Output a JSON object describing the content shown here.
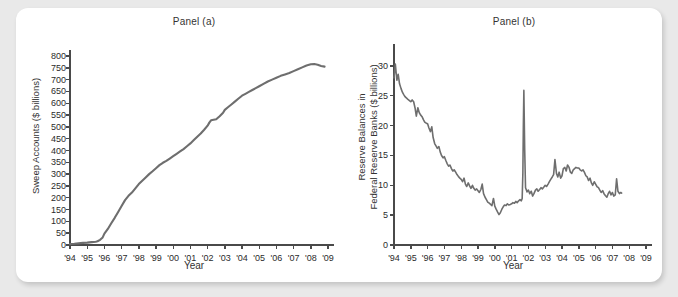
{
  "figure": {
    "background_color": "#e9e9e9",
    "card_color": "#ffffff",
    "line_color": "#6e6e6e",
    "axis_color": "#4a4a4a",
    "grid_color": "#9a9a9a"
  },
  "panels": [
    {
      "key": "a",
      "title": "Panel (a)",
      "ylabel": "Sweep Accounts ($ billions)",
      "xlabel": "Year"
    },
    {
      "key": "b",
      "title": "Panel (b)",
      "ylabel_line1": "Reserve Balances in",
      "ylabel_line2": "Federal Reserve Banks ($ billions)",
      "xlabel": "Year"
    }
  ],
  "chart_data": [
    {
      "type": "line",
      "panel": "a",
      "title": "Panel (a)",
      "xlabel": "Year",
      "ylabel": "Sweep Accounts ($ billions)",
      "xlim": [
        1994,
        2009
      ],
      "ylim": [
        0,
        800
      ],
      "ytick_values": [
        0,
        50,
        100,
        150,
        200,
        250,
        300,
        350,
        400,
        450,
        500,
        550,
        600,
        650,
        700,
        750,
        800
      ],
      "ytick_labels": [
        "0",
        "50",
        "100",
        "150",
        "200",
        "250",
        "300",
        "350",
        "400",
        "450",
        "500",
        "550",
        "600",
        "650",
        "700",
        "750",
        "800"
      ],
      "xtick_values": [
        1994,
        1995,
        1996,
        1997,
        1998,
        1999,
        2000,
        2001,
        2002,
        2003,
        2004,
        2005,
        2006,
        2007,
        2008,
        2009
      ],
      "xtick_labels": [
        "'94",
        "'95",
        "'96",
        "'97",
        "'98",
        "'99",
        "'00",
        "'01",
        "'02",
        "'03",
        "'04",
        "'05",
        "'06",
        "'07",
        "'08",
        "'09"
      ],
      "grid": "horizontal-dotted",
      "legend": "none",
      "series": [
        {
          "name": "Sweep Accounts",
          "x": [
            1994.0,
            1994.25,
            1994.5,
            1994.75,
            1995.0,
            1995.25,
            1995.5,
            1995.6,
            1995.75,
            1995.9,
            1996.0,
            1996.2,
            1996.4,
            1996.6,
            1996.8,
            1997.0,
            1997.2,
            1997.4,
            1997.6,
            1997.8,
            1998.0,
            1998.2,
            1998.4,
            1998.6,
            1998.8,
            1999.0,
            1999.2,
            1999.4,
            1999.6,
            1999.8,
            2000.0,
            2000.2,
            2000.4,
            2000.6,
            2000.8,
            2001.0,
            2001.2,
            2001.4,
            2001.6,
            2001.8,
            2002.0,
            2002.1,
            2002.2,
            2002.35,
            2002.5,
            2002.7,
            2002.9,
            2003.0,
            2003.2,
            2003.4,
            2003.6,
            2003.8,
            2004.0,
            2004.2,
            2004.4,
            2004.6,
            2004.8,
            2005.0,
            2005.25,
            2005.5,
            2005.75,
            2006.0,
            2006.25,
            2006.5,
            2006.75,
            2007.0,
            2007.25,
            2007.5,
            2007.75,
            2008.0,
            2008.2,
            2008.4,
            2008.6,
            2008.8
          ],
          "y": [
            4,
            5,
            7,
            9,
            10,
            12,
            14,
            16,
            22,
            32,
            48,
            68,
            92,
            115,
            140,
            165,
            190,
            208,
            222,
            240,
            258,
            272,
            286,
            300,
            312,
            325,
            338,
            348,
            356,
            366,
            376,
            386,
            396,
            406,
            418,
            430,
            444,
            458,
            472,
            488,
            505,
            518,
            528,
            530,
            532,
            545,
            560,
            572,
            584,
            596,
            608,
            620,
            632,
            640,
            648,
            656,
            664,
            672,
            682,
            692,
            700,
            708,
            716,
            722,
            728,
            736,
            744,
            752,
            760,
            765,
            766,
            763,
            758,
            755
          ]
        }
      ]
    },
    {
      "type": "line",
      "panel": "b",
      "title": "Panel (b)",
      "xlabel": "Year",
      "ylabel": "Reserve Balances in Federal Reserve Banks ($ billions)",
      "xlim": [
        1994,
        2009
      ],
      "ylim": [
        0,
        32
      ],
      "ytick_values": [
        0,
        5,
        10,
        15,
        20,
        25,
        30
      ],
      "ytick_labels": [
        "0",
        "5",
        "10",
        "15",
        "20",
        "25",
        "30"
      ],
      "xtick_values": [
        1994,
        1995,
        1996,
        1997,
        1998,
        1999,
        2000,
        2001,
        2002,
        2003,
        2004,
        2005,
        2006,
        2007,
        2008,
        2009
      ],
      "xtick_labels": [
        "'94",
        "'95",
        "'96",
        "'97",
        "'98",
        "'99",
        "'00",
        "'01",
        "'02",
        "'03",
        "'04",
        "'05",
        "'06",
        "'07",
        "'08",
        "'09"
      ],
      "grid": "horizontal-dotted",
      "legend": "none",
      "series": [
        {
          "name": "Reserve Balances",
          "x": [
            1994.0,
            1994.08,
            1994.17,
            1994.25,
            1994.33,
            1994.42,
            1994.5,
            1994.58,
            1994.67,
            1994.75,
            1994.83,
            1994.92,
            1995.0,
            1995.08,
            1995.17,
            1995.25,
            1995.33,
            1995.42,
            1995.5,
            1995.58,
            1995.67,
            1995.75,
            1995.83,
            1995.92,
            1996.0,
            1996.08,
            1996.17,
            1996.25,
            1996.33,
            1996.42,
            1996.5,
            1996.58,
            1996.67,
            1996.75,
            1996.83,
            1996.92,
            1997.0,
            1997.08,
            1997.17,
            1997.25,
            1997.33,
            1997.42,
            1997.5,
            1997.58,
            1997.67,
            1997.75,
            1997.83,
            1997.92,
            1998.0,
            1998.08,
            1998.17,
            1998.25,
            1998.33,
            1998.42,
            1998.5,
            1998.58,
            1998.67,
            1998.75,
            1998.83,
            1998.92,
            1999.0,
            1999.08,
            1999.17,
            1999.25,
            1999.33,
            1999.42,
            1999.5,
            1999.58,
            1999.67,
            1999.75,
            1999.83,
            1999.92,
            2000.0,
            2000.08,
            2000.17,
            2000.25,
            2000.33,
            2000.42,
            2000.5,
            2000.58,
            2000.67,
            2000.75,
            2000.83,
            2000.92,
            2001.0,
            2001.08,
            2001.17,
            2001.25,
            2001.33,
            2001.42,
            2001.5,
            2001.58,
            2001.63,
            2001.67,
            2001.7,
            2001.73,
            2001.78,
            2001.83,
            2001.92,
            2002.0,
            2002.08,
            2002.17,
            2002.25,
            2002.33,
            2002.42,
            2002.5,
            2002.58,
            2002.67,
            2002.75,
            2002.83,
            2002.92,
            2003.0,
            2003.08,
            2003.17,
            2003.25,
            2003.33,
            2003.42,
            2003.5,
            2003.58,
            2003.67,
            2003.75,
            2003.83,
            2003.92,
            2004.0,
            2004.08,
            2004.17,
            2004.25,
            2004.33,
            2004.42,
            2004.5,
            2004.58,
            2004.67,
            2004.75,
            2004.83,
            2004.92,
            2005.0,
            2005.08,
            2005.17,
            2005.25,
            2005.33,
            2005.42,
            2005.5,
            2005.58,
            2005.67,
            2005.75,
            2005.83,
            2005.92,
            2006.0,
            2006.08,
            2006.17,
            2006.25,
            2006.33,
            2006.42,
            2006.5,
            2006.58,
            2006.67,
            2006.75,
            2006.83,
            2006.92,
            2007.0,
            2007.08,
            2007.17,
            2007.25,
            2007.33,
            2007.42,
            2007.5,
            2007.55
          ],
          "y": [
            28.0,
            30.3,
            27.6,
            28.6,
            27.0,
            26.2,
            25.6,
            25.2,
            24.8,
            24.6,
            24.4,
            24.2,
            24.0,
            24.3,
            24.0,
            23.0,
            21.6,
            23.0,
            22.2,
            21.8,
            21.5,
            21.0,
            20.6,
            20.4,
            20.3,
            19.6,
            19.0,
            19.8,
            18.0,
            17.0,
            16.6,
            16.2,
            16.5,
            15.6,
            15.0,
            14.6,
            14.8,
            14.2,
            13.6,
            13.2,
            13.4,
            12.8,
            12.4,
            12.6,
            12.2,
            11.8,
            11.5,
            11.2,
            11.0,
            10.6,
            11.2,
            10.2,
            9.8,
            10.4,
            9.9,
            9.5,
            10.0,
            9.5,
            9.2,
            9.4,
            9.1,
            8.8,
            9.3,
            10.2,
            8.6,
            8.0,
            7.6,
            7.2,
            7.0,
            6.8,
            6.6,
            7.8,
            6.5,
            6.0,
            5.5,
            5.1,
            5.4,
            6.0,
            6.4,
            6.7,
            6.6,
            6.9,
            6.7,
            6.8,
            6.9,
            7.1,
            7.0,
            7.3,
            7.1,
            7.4,
            7.6,
            7.4,
            7.8,
            12.0,
            20.0,
            25.9,
            16.0,
            9.6,
            8.9,
            9.2,
            8.6,
            9.0,
            8.2,
            8.6,
            9.2,
            9.4,
            9.0,
            9.3,
            9.6,
            9.4,
            9.7,
            10.0,
            9.8,
            10.2,
            10.6,
            11.0,
            11.4,
            11.8,
            14.3,
            12.0,
            11.4,
            12.2,
            11.2,
            11.6,
            12.8,
            13.0,
            12.4,
            13.4,
            13.0,
            12.2,
            12.0,
            12.6,
            12.8,
            13.0,
            12.9,
            12.9,
            12.6,
            12.4,
            12.6,
            12.2,
            11.6,
            11.4,
            10.8,
            11.2,
            10.4,
            10.0,
            10.6,
            10.2,
            9.8,
            9.6,
            9.2,
            8.8,
            9.1,
            8.6,
            8.3,
            8.0,
            8.6,
            9.0,
            8.4,
            8.8,
            8.2,
            8.4,
            11.1,
            9.0,
            8.6,
            8.8,
            8.7
          ]
        }
      ]
    }
  ]
}
